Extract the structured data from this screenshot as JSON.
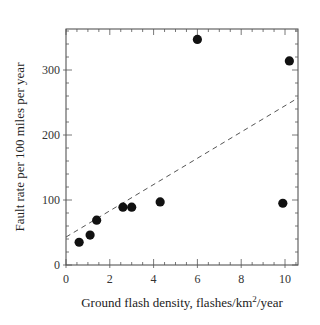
{
  "chart_data": {
    "type": "scatter",
    "title": "",
    "xlabel": "Ground flash density, flashes/km²/year",
    "xlabel_parts": {
      "main": "Ground flash density, flashes/km",
      "sup": "2",
      "tail": "/year"
    },
    "ylabel": "Fault rate per 100 miles per year",
    "xlim": [
      0,
      10.6
    ],
    "ylim": [
      0,
      385
    ],
    "xticks": [
      0,
      2,
      4,
      6,
      8,
      10
    ],
    "yticks": [
      0,
      100,
      200,
      300
    ],
    "grid": false,
    "legend": null,
    "series": [
      {
        "name": "Observed fault rate",
        "marker": "filled-circle",
        "color": "#111111",
        "points": [
          {
            "x": 0.6,
            "y": 35
          },
          {
            "x": 1.1,
            "y": 46
          },
          {
            "x": 1.4,
            "y": 69
          },
          {
            "x": 2.6,
            "y": 89
          },
          {
            "x": 3.0,
            "y": 89
          },
          {
            "x": 4.3,
            "y": 97
          },
          {
            "x": 6.0,
            "y": 347
          },
          {
            "x": 10.2,
            "y": 314
          },
          {
            "x": 9.9,
            "y": 95
          }
        ]
      },
      {
        "name": "Linear fit",
        "style": "dashed",
        "color": "#555555",
        "points": [
          {
            "x": 0,
            "y": 43
          },
          {
            "x": 10.6,
            "y": 257
          }
        ]
      }
    ]
  }
}
